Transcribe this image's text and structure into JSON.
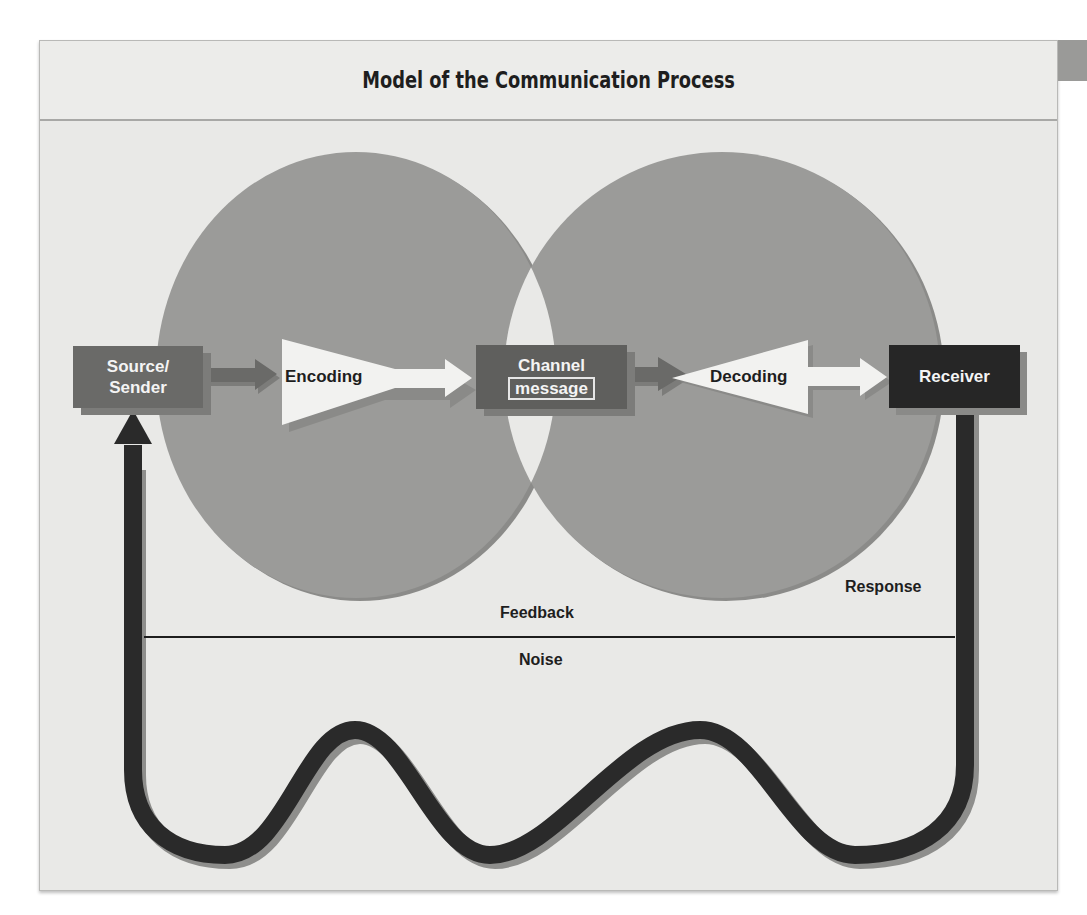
{
  "title": "Model of the Communication Process",
  "nodes": {
    "source": {
      "line1": "Source/",
      "line2": "Sender"
    },
    "encoding": "Encoding",
    "channel": {
      "line1": "Channel",
      "line2": "message"
    },
    "decoding": "Decoding",
    "receiver": "Receiver"
  },
  "labels": {
    "response": "Response",
    "feedback": "Feedback",
    "noise": "Noise"
  },
  "colors": {
    "background": "#e9e9e7",
    "circle_fill": "#9b9b99",
    "source_box": "#6a6a68",
    "channel_box": "#5f5f5d",
    "receiver_box": "#262626",
    "feedback_loop": "#2a2a2a",
    "arrow_light": "#f2f2f0"
  }
}
